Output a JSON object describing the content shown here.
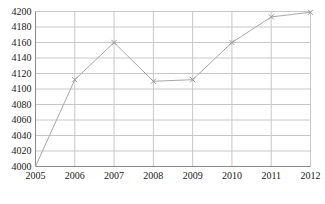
{
  "chart_data": {
    "type": "line",
    "title": "",
    "subtitle": "",
    "xlabel": "",
    "ylabel": "",
    "categories": [
      "2005",
      "2006",
      "2007",
      "2008",
      "2009",
      "2010",
      "2011",
      "2012"
    ],
    "values": [
      4000,
      4112,
      4160,
      4110,
      4112,
      4160,
      4193,
      4199
    ],
    "series": [
      {
        "name": "",
        "values": [
          4000,
          4112,
          4160,
          4110,
          4112,
          4160,
          4193,
          4199
        ]
      }
    ],
    "ylim": [
      4000,
      4200
    ],
    "ytick_step": 20,
    "yticks": [
      4000,
      4020,
      4040,
      4060,
      4080,
      4100,
      4120,
      4140,
      4160,
      4180,
      4200
    ],
    "ytick_labels": [
      "4000",
      "4020",
      "4040",
      "4060",
      "4080",
      "4100",
      "4120",
      "4140",
      "4160",
      "4180",
      "4200"
    ],
    "xticks": [
      "2005",
      "2006",
      "2007",
      "2008",
      "2009",
      "2010",
      "2011",
      "2012"
    ],
    "grid": true,
    "grid_color": "#c8c8c8",
    "legend": false,
    "legend_position": "none",
    "line_color": "#a8a8a8",
    "marker": "x",
    "marker_color": "#9a9a9a",
    "background_color": "#ffffff",
    "annotations": []
  }
}
